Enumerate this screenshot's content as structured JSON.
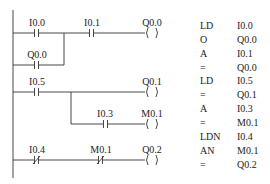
{
  "ladder": {
    "rungs": [
      {
        "contacts": [
          {
            "label": "I0.0",
            "type": "NO"
          },
          {
            "label": "I0.1",
            "type": "NO"
          }
        ],
        "parallel": [
          {
            "label": "Q0.0",
            "type": "NO"
          }
        ],
        "coil": {
          "label": "Q0.0",
          "symbol": "( )"
        }
      },
      {
        "contacts": [
          {
            "label": "I0.5",
            "type": "NO"
          }
        ],
        "coil": {
          "label": "Q0.1",
          "symbol": "( )"
        },
        "branch": {
          "contacts": [
            {
              "label": "I0.3",
              "type": "NO"
            }
          ],
          "coil": {
            "label": "M0.1",
            "symbol": "( )"
          }
        }
      },
      {
        "contacts": [
          {
            "label": "I0.4",
            "type": "NC"
          },
          {
            "label": "M0.1",
            "type": "NC"
          }
        ],
        "coil": {
          "label": "Q0.2",
          "symbol": "( )"
        }
      }
    ]
  },
  "instruction_list": [
    {
      "op": "LD",
      "arg": "I0.0"
    },
    {
      "op": "O",
      "arg": "Q0.0"
    },
    {
      "op": "A",
      "arg": "I0.1"
    },
    {
      "op": "=",
      "arg": "Q0.0"
    },
    {
      "op": "LD",
      "arg": "I0.5"
    },
    {
      "op": "=",
      "arg": "Q0.1"
    },
    {
      "op": "A",
      "arg": "I0.3"
    },
    {
      "op": "=",
      "arg": "M0.1"
    },
    {
      "op": "LDN",
      "arg": "I0.4"
    },
    {
      "op": "AN",
      "arg": "M0.1"
    },
    {
      "op": "=",
      "arg": "Q0.2"
    }
  ]
}
